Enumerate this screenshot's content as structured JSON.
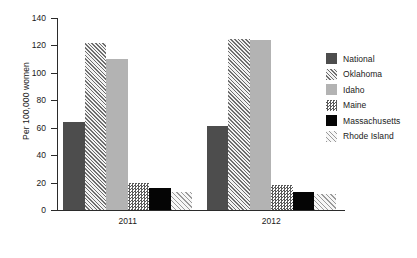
{
  "chart_data": {
    "type": "bar",
    "title": "",
    "xlabel": "",
    "ylabel": "Per 100,000 women",
    "categories": [
      "2011",
      "2012"
    ],
    "ylim": [
      0,
      140
    ],
    "yticks": [
      0,
      20,
      40,
      60,
      80,
      100,
      120,
      140
    ],
    "ytick_labels": [
      "0",
      "20",
      "40",
      "60",
      "80",
      "100",
      "120",
      "140"
    ],
    "grid": false,
    "legend_position": "right",
    "series": [
      {
        "name": "National",
        "values": [
          64,
          61
        ],
        "color": "#4d4d4d",
        "pattern": "solid-dark-gray"
      },
      {
        "name": "Oklahoma",
        "values": [
          122,
          125
        ],
        "color": "#6e6e6e",
        "pattern": "diagonal-hatch-dense"
      },
      {
        "name": "Idaho",
        "values": [
          110,
          124
        ],
        "color": "#b3b3b3",
        "pattern": "solid-light-gray"
      },
      {
        "name": "Maine",
        "values": [
          20,
          18
        ],
        "color": "#5a5a5a",
        "pattern": "checkerboard"
      },
      {
        "name": "Massachusetts",
        "values": [
          16,
          13
        ],
        "color": "#050505",
        "pattern": "solid-black"
      },
      {
        "name": "Rhode Island",
        "values": [
          13,
          12
        ],
        "color": "#9a9a9a",
        "pattern": "diagonal-hatch-light"
      }
    ]
  },
  "legend": {
    "items": [
      {
        "label": "National"
      },
      {
        "label": "Oklahoma"
      },
      {
        "label": "Idaho"
      },
      {
        "label": "Maine"
      },
      {
        "label": "Massachusetts"
      },
      {
        "label": "Rhode Island"
      }
    ]
  }
}
